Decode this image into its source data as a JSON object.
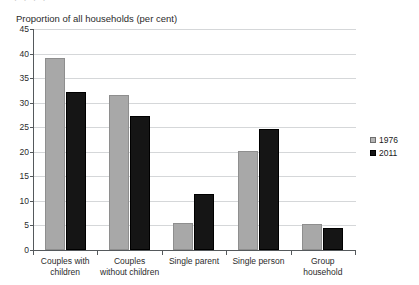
{
  "top_strip_ghost_text": "· ·   ·   ·",
  "chart_data": {
    "type": "bar",
    "title": "Proportion of all households (per cent)",
    "xlabel": "",
    "ylabel": "",
    "ylim": [
      0,
      45
    ],
    "ytick_step": 5,
    "yticks": [
      0,
      5,
      10,
      15,
      20,
      25,
      30,
      35,
      40,
      45
    ],
    "ytick_labels": [
      "0",
      "5",
      "10",
      "15",
      "20",
      "25",
      "30",
      "35",
      "40",
      "45"
    ],
    "grid": true,
    "legend_position": "right",
    "categories": [
      "Couples with children",
      "Couples without children",
      "Single parent",
      "Single person",
      "Group household"
    ],
    "category_lines": [
      [
        "Couples with",
        "children"
      ],
      [
        "Couples",
        "without children"
      ],
      [
        "Single parent"
      ],
      [
        "Single person"
      ],
      [
        "Group",
        "household"
      ]
    ],
    "series": [
      {
        "name": "1976",
        "color": "#a8a8a8",
        "values": [
          39.0,
          31.6,
          5.4,
          20.2,
          5.3
        ]
      },
      {
        "name": "2011",
        "color": "#151515",
        "values": [
          32.1,
          27.2,
          11.5,
          24.6,
          4.5
        ]
      }
    ]
  },
  "legend": {
    "entries": [
      {
        "label": "1976",
        "swatch": "light-gray-square"
      },
      {
        "label": "2011",
        "swatch": "black-square"
      }
    ]
  }
}
